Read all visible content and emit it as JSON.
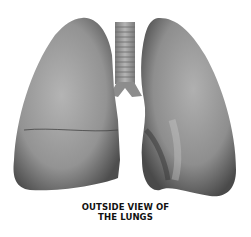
{
  "figure": {
    "caption_line1": "OUTSIDE VIEW OF",
    "caption_line2": "THE LUNGS"
  },
  "colors": {
    "lung_light": "#a9a9a9",
    "lung_mid": "#8a8a8a",
    "lung_dark": "#4a4a4a",
    "trachea": "#9a9a9a",
    "background": "#ffffff"
  }
}
